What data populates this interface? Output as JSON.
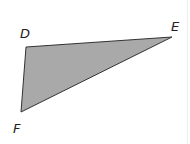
{
  "figure": {
    "type": "triangle",
    "fill_color": "#a9a9a9",
    "stroke_color": "#333333",
    "vertices": [
      {
        "name": "D",
        "x": 26,
        "y": 47,
        "label": "D",
        "label_x": 20,
        "label_y": 38
      },
      {
        "name": "E",
        "x": 172,
        "y": 37,
        "label": "E",
        "label_x": 171,
        "label_y": 31
      },
      {
        "name": "F",
        "x": 21,
        "y": 112,
        "label": "F",
        "label_x": 13,
        "label_y": 133
      }
    ]
  }
}
